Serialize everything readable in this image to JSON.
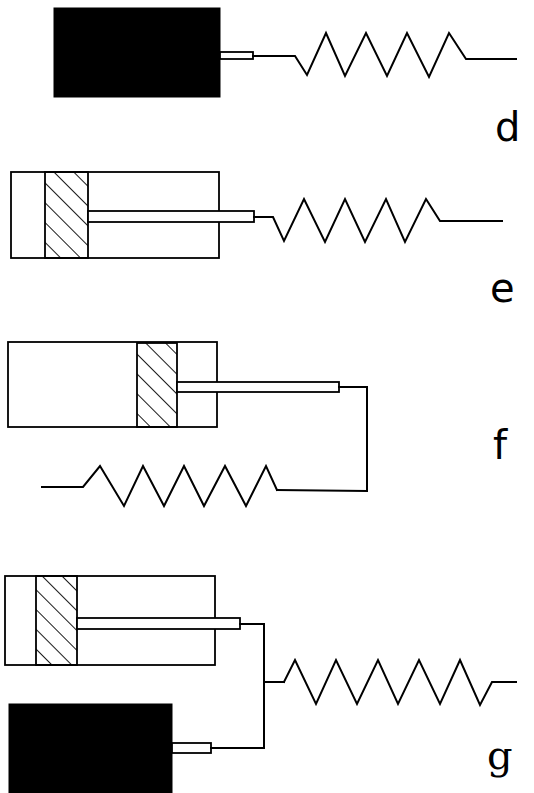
{
  "figure": {
    "panels": [
      {
        "id": "d",
        "label": "d",
        "description": "Solid mass connected by a short rod to a spring"
      },
      {
        "id": "e",
        "label": "e",
        "description": "Dashpot (cylinder with hatched piston at left) whose rod connects to a spring"
      },
      {
        "id": "f",
        "label": "f",
        "description": "Dashpot with hatched piston near right end; rod loops down and back to a spring underneath"
      },
      {
        "id": "g",
        "label": "g",
        "description": "Dashpot and solid mass in parallel, both rods joined to a common spring"
      }
    ]
  },
  "colors": {
    "ink": "#000000",
    "paper": "#ffffff"
  }
}
